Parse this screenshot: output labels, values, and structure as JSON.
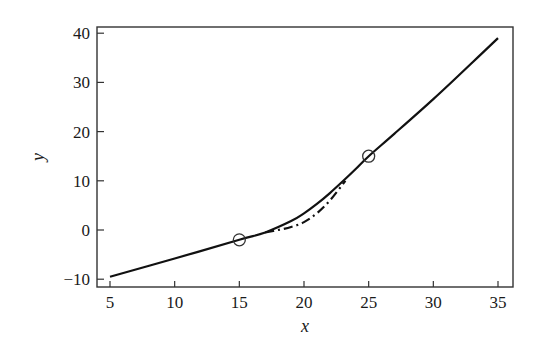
{
  "chart_data": {
    "type": "line",
    "title": "",
    "xlabel": "x",
    "ylabel": "y",
    "xlim": [
      4.2,
      36.2
    ],
    "ylim": [
      -11.5,
      41.5
    ],
    "xticks": [
      5,
      10,
      15,
      20,
      25,
      30,
      35
    ],
    "yticks": [
      -10,
      0,
      10,
      20,
      30,
      40
    ],
    "xtick_labels": [
      "5",
      "10",
      "15",
      "20",
      "25",
      "30",
      "35"
    ],
    "ytick_labels": [
      "−10",
      "0",
      "10",
      "20",
      "30",
      "40"
    ],
    "grid": false,
    "legend": null,
    "series": [
      {
        "name": "solid",
        "style": "solid",
        "x": [
          5,
          10,
          15,
          17,
          19,
          20,
          21,
          22,
          23,
          24,
          25,
          27,
          30,
          33,
          35
        ],
        "y": [
          -9.5,
          -5.8,
          -2.0,
          -0.5,
          1.8,
          3.4,
          5.3,
          7.5,
          9.9,
          12.4,
          15.0,
          19.6,
          26.6,
          34.0,
          39.0
        ]
      },
      {
        "name": "dash-dot",
        "style": "dashdot",
        "x": [
          17,
          18,
          19,
          20,
          21,
          22,
          23.2
        ],
        "y": [
          -0.5,
          0.0,
          0.6,
          1.6,
          3.4,
          6.0,
          10.0
        ]
      }
    ],
    "markers": [
      {
        "x": 15,
        "y": -2,
        "shape": "open-circle"
      },
      {
        "x": 25,
        "y": 15,
        "shape": "open-circle"
      }
    ]
  }
}
